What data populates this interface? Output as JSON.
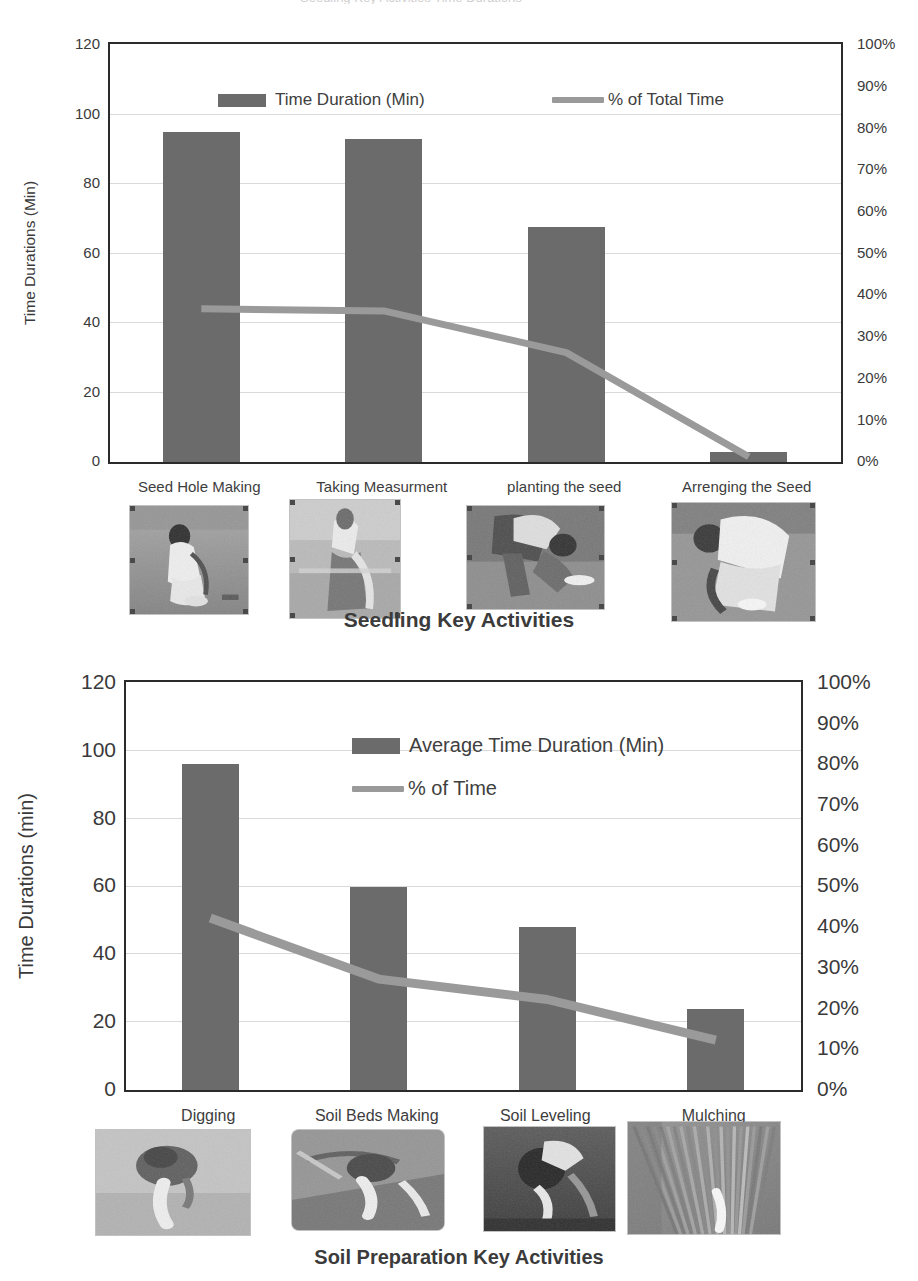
{
  "page": {
    "clipped_top_title": "Seedling Key Activities Time Durations"
  },
  "chart_data": [
    {
      "id": "seedling",
      "type": "bar",
      "title": "",
      "xlabel": "Seedling Key Activities",
      "ylabel": "Time Durations (Min)",
      "ylim": [
        0,
        120
      ],
      "ytick_labels": [
        "0",
        "20",
        "40",
        "60",
        "80",
        "100",
        "120"
      ],
      "y2label": "",
      "y2lim": [
        0,
        100
      ],
      "y2tick_labels": [
        "0%",
        "10%",
        "20%",
        "30%",
        "40%",
        "50%",
        "60%",
        "70%",
        "80%",
        "90%",
        "100%"
      ],
      "grid": true,
      "legend_position": "inside-top",
      "categories": [
        "Seed Hole Making",
        "Taking Measurment",
        "planting the seed",
        "Arrenging the Seed"
      ],
      "series": [
        {
          "name": "Time Duration (Min)",
          "kind": "bar",
          "axis": "left",
          "color": "#6b6b6b",
          "values": [
            95,
            93,
            67.5,
            3
          ]
        },
        {
          "name": "% of Total Time",
          "kind": "line",
          "axis": "right",
          "color": "#9a9a9a",
          "values": [
            36.5,
            36,
            26,
            1
          ]
        }
      ],
      "thumbnails": [
        {
          "caption": "Seed Hole Making",
          "alt": "farmer bending over making a seed hole in soil"
        },
        {
          "caption": "Taking Measurment",
          "alt": "farmer measuring row spacing with a rope"
        },
        {
          "caption": "planting the seed",
          "alt": "farmer bending down planting a seed"
        },
        {
          "caption": "Arrenging the Seed",
          "alt": "farmer arranging seeds from a bowl"
        }
      ]
    },
    {
      "id": "soil-preparation",
      "type": "bar",
      "title": "",
      "xlabel": "Soil Preparation Key Activities",
      "ylabel": "Time Durations (min)",
      "ylim": [
        0,
        120
      ],
      "ytick_labels": [
        "0",
        "20",
        "40",
        "60",
        "80",
        "100",
        "120"
      ],
      "y2label": "",
      "y2lim": [
        0,
        100
      ],
      "y2tick_labels": [
        "0%",
        "10%",
        "20%",
        "30%",
        "40%",
        "50%",
        "60%",
        "70%",
        "80%",
        "90%",
        "100%"
      ],
      "grid": true,
      "legend_position": "inside-top",
      "categories": [
        "Digging",
        "Soil Beds Making",
        "Soil Leveling",
        "Mulching"
      ],
      "series": [
        {
          "name": "Average Time Duration (Min)",
          "kind": "bar",
          "axis": "left",
          "color": "#6b6b6b",
          "values": [
            96,
            60,
            48,
            24
          ]
        },
        {
          "name": "% of Time",
          "kind": "line",
          "axis": "right",
          "color": "#9a9a9a",
          "values": [
            42,
            27,
            22,
            12
          ]
        }
      ],
      "thumbnails": [
        {
          "caption": "Digging",
          "alt": "farmer digging soil with a hoe"
        },
        {
          "caption": "Soil Beds Making",
          "alt": "farmer making raised soil beds"
        },
        {
          "caption": "Soil Leveling",
          "alt": "farmer leveling dark soil"
        },
        {
          "caption": "Mulching",
          "alt": "mulched field with straw spread over soil"
        }
      ]
    }
  ]
}
